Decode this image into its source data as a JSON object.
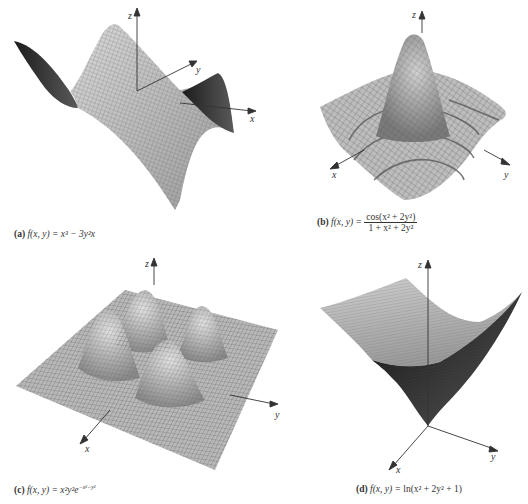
{
  "figures": [
    {
      "id": "a",
      "label": "(a)",
      "function_text": "f(x, y) = x³ − 3y²x",
      "caption_parts": {
        "lhs": "f(x, y) = ",
        "rhs": "x³ − 3y²x"
      },
      "axes": {
        "x": "x",
        "y": "y",
        "z": "z"
      },
      "surface_type": "monkey saddle"
    },
    {
      "id": "b",
      "label": "(b)",
      "function_text": "f(x, y) = cos(x² + 2y²) / (1 + x² + 2y²)",
      "caption_parts": {
        "lhs": "f(x, y) = ",
        "numerator": "cos(x² + 2y²)",
        "denominator": "1 + x² + 2y²"
      },
      "axes": {
        "x": "x",
        "y": "y",
        "z": "z"
      },
      "surface_type": "damped ripple with central peak"
    },
    {
      "id": "c",
      "label": "(c)",
      "function_text": "f(x, y) = x²y²e^(−x²−y²)",
      "caption_parts": {
        "lhs": "f(x, y) = ",
        "base": "x²y²e",
        "exponent": "−x²−y²"
      },
      "axes": {
        "x": "x",
        "y": "y",
        "z": "z"
      },
      "surface_type": "four humps on flat plane"
    },
    {
      "id": "d",
      "label": "(d)",
      "function_text": "f(x, y) = ln(x² + 2y² + 1)",
      "caption_parts": {
        "lhs": "f(x, y) = ",
        "rhs": "ln(x² + 2y² + 1)"
      },
      "axes": {
        "x": "x",
        "y": "y",
        "z": "z"
      },
      "surface_type": "logarithmic bowl"
    }
  ],
  "colors": {
    "mesh_light": "#c8c8c8",
    "mesh_mid": "#8a8a8a",
    "mesh_dark": "#2a2a2a",
    "axis": "#333333",
    "background": "#ffffff"
  }
}
